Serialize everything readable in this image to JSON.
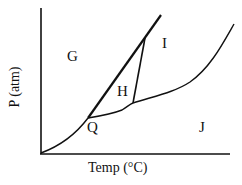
{
  "diagram": {
    "type": "phase-diagram",
    "x_axis_label": "Temp (°C)",
    "y_axis_label": "P (atm)",
    "regions": {
      "G": "G",
      "H": "H",
      "I": "I",
      "J": "J"
    },
    "points": {
      "Q": "Q"
    },
    "colors": {
      "line": "#111111",
      "background": "#ffffff"
    }
  }
}
